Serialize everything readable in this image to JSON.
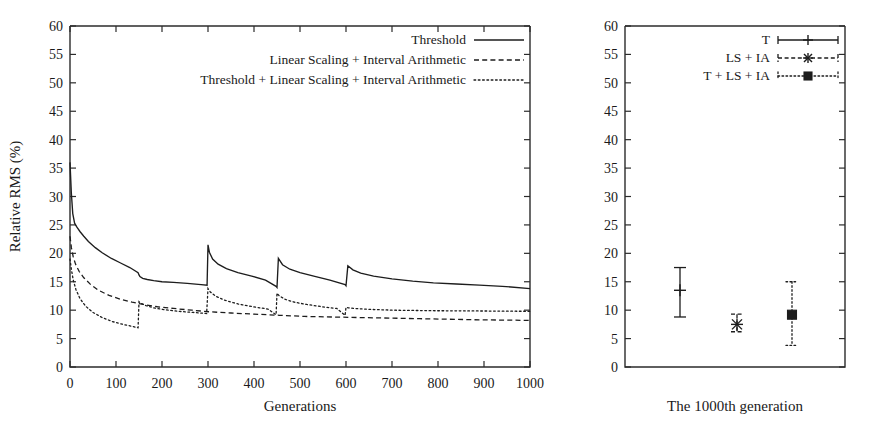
{
  "figure": {
    "background": "#ffffff",
    "ink_color": "#1d1d1d"
  },
  "chart_data": [
    {
      "panel": "left",
      "type": "line",
      "title": "",
      "xlabel": "Generations",
      "ylabel": "Relative RMS (%)",
      "xlim": [
        0,
        1000
      ],
      "ylim": [
        0,
        60
      ],
      "xticks": [
        0,
        100,
        200,
        300,
        400,
        500,
        600,
        700,
        800,
        900,
        1000
      ],
      "yticks": [
        0,
        5,
        10,
        15,
        20,
        25,
        30,
        35,
        40,
        45,
        50,
        55,
        60
      ],
      "grid": false,
      "legend_position": "top-right inside",
      "restart_generations": [
        150,
        300,
        450,
        600
      ],
      "series": [
        {
          "name": "Threshold",
          "style": "solid",
          "x": [
            0,
            3,
            6,
            10,
            15,
            22,
            30,
            40,
            55,
            70,
            90,
            110,
            130,
            148,
            150,
            152,
            158,
            168,
            182,
            200,
            225,
            255,
            285,
            298,
            300,
            303,
            310,
            322,
            340,
            365,
            395,
            425,
            448,
            450,
            453,
            462,
            478,
            500,
            530,
            565,
            598,
            600,
            604,
            615,
            632,
            660,
            700,
            745,
            790,
            840,
            890,
            940,
            1000
          ],
          "y": [
            36.0,
            30.5,
            27.0,
            25.3,
            24.6,
            23.8,
            23.0,
            22.1,
            21.0,
            20.1,
            19.1,
            18.3,
            17.5,
            16.6,
            16.2,
            15.9,
            15.6,
            15.4,
            15.2,
            15.0,
            14.9,
            14.7,
            14.5,
            14.4,
            21.5,
            20.2,
            19.0,
            18.1,
            17.3,
            16.6,
            16.0,
            15.3,
            14.2,
            14.0,
            19.1,
            18.0,
            17.2,
            16.6,
            16.0,
            15.3,
            14.5,
            14.3,
            17.8,
            17.1,
            16.5,
            16.0,
            15.5,
            15.1,
            14.8,
            14.6,
            14.4,
            14.2,
            13.8
          ]
        },
        {
          "name": "Linear Scaling + Interval Arithmetic",
          "style": "dashed",
          "x": [
            0,
            3,
            7,
            12,
            20,
            30,
            45,
            62,
            85,
            110,
            135,
            160,
            190,
            225,
            265,
            305,
            350,
            400,
            455,
            510,
            570,
            630,
            695,
            760,
            825,
            890,
            950,
            1000
          ],
          "y": [
            23.0,
            21.0,
            19.4,
            18.1,
            16.8,
            15.7,
            14.5,
            13.5,
            12.6,
            11.9,
            11.4,
            11.0,
            10.6,
            10.3,
            10.0,
            9.7,
            9.5,
            9.3,
            9.1,
            8.9,
            8.8,
            8.7,
            8.6,
            8.5,
            8.4,
            8.3,
            8.25,
            8.2
          ]
        },
        {
          "name": "Threshold + Linear Scaling + Interval Arithmetic",
          "style": "dotted",
          "x": [
            0,
            3,
            7,
            13,
            22,
            34,
            50,
            70,
            92,
            115,
            138,
            148,
            150,
            154,
            165,
            182,
            205,
            235,
            268,
            297,
            300,
            305,
            318,
            338,
            365,
            398,
            430,
            448,
            450,
            455,
            468,
            488,
            515,
            548,
            580,
            598,
            600,
            605,
            618,
            638,
            665,
            700,
            745,
            795,
            850,
            905,
            955,
            1000
          ],
          "y": [
            19.0,
            17.2,
            15.3,
            13.6,
            12.0,
            10.7,
            9.6,
            8.7,
            8.0,
            7.5,
            7.1,
            6.9,
            11.5,
            11.2,
            10.8,
            10.4,
            10.1,
            9.8,
            9.6,
            9.4,
            13.8,
            13.2,
            12.4,
            11.7,
            11.1,
            10.6,
            10.2,
            9.2,
            13.0,
            12.5,
            11.9,
            11.4,
            11.0,
            10.6,
            10.3,
            9.1,
            10.5,
            10.4,
            10.3,
            10.2,
            10.1,
            10.0,
            9.95,
            9.9,
            9.88,
            9.85,
            9.82,
            9.8
          ]
        }
      ]
    },
    {
      "panel": "right",
      "type": "errorbar",
      "title": "",
      "xlabel": "The 1000th generation",
      "ylabel": "",
      "ylim": [
        0,
        60
      ],
      "yticks": [
        0,
        5,
        10,
        15,
        20,
        25,
        30,
        35,
        40,
        45,
        50,
        55,
        60
      ],
      "grid": false,
      "legend_position": "top-right inside",
      "points": [
        {
          "name": "T",
          "style": "solid",
          "marker": "plus",
          "mean": 13.5,
          "low": 8.8,
          "high": 17.5
        },
        {
          "name": "LS + IA",
          "style": "dashed",
          "marker": "cross",
          "mean": 7.5,
          "low": 6.2,
          "high": 9.3
        },
        {
          "name": "T + LS + IA",
          "style": "dotted",
          "marker": "filled-square",
          "mean": 9.2,
          "low": 3.8,
          "high": 15.0
        }
      ]
    }
  ],
  "left_panel": {
    "y_axis_title": "Relative RMS (%)",
    "x_axis_title": "Generations",
    "y_ticks": [
      "0",
      "5",
      "10",
      "15",
      "20",
      "25",
      "30",
      "35",
      "40",
      "45",
      "50",
      "55",
      "60"
    ],
    "x_ticks": [
      "0",
      "100",
      "200",
      "300",
      "400",
      "500",
      "600",
      "700",
      "800",
      "900",
      "1000"
    ],
    "legend": [
      {
        "label": "Threshold",
        "style": "solid"
      },
      {
        "label": "Linear Scaling + Interval Arithmetic",
        "style": "dashed"
      },
      {
        "label": "Threshold + Linear Scaling + Interval Arithmetic",
        "style": "dotted"
      }
    ]
  },
  "right_panel": {
    "caption": "The 1000th generation",
    "y_ticks": [
      "0",
      "5",
      "10",
      "15",
      "20",
      "25",
      "30",
      "35",
      "40",
      "45",
      "50",
      "55",
      "60"
    ],
    "legend": [
      {
        "label": "T",
        "style": "solid",
        "marker": "plus"
      },
      {
        "label": "LS + IA",
        "style": "dashed",
        "marker": "cross"
      },
      {
        "label": "T + LS + IA",
        "style": "dotted",
        "marker": "filled-square"
      }
    ]
  }
}
